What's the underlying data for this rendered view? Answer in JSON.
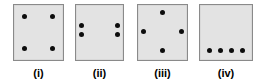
{
  "figure": {
    "width": 265,
    "height": 84,
    "background_color": "#ffffff",
    "square_fill_color": "#e3e3e3",
    "square_border_color": "#8a8a8a",
    "dot_color": "#0d0d0d",
    "dot_count_per_square": 4
  },
  "panels": [
    {
      "label": "(i)",
      "x": 13,
      "y": 4,
      "width": 51,
      "arrangement": "four-corners",
      "dots": [
        {
          "x": 21,
          "y": 21
        },
        {
          "x": 79,
          "y": 21
        },
        {
          "x": 21,
          "y": 79
        },
        {
          "x": 79,
          "y": 79
        }
      ]
    },
    {
      "label": "(ii)",
      "x": 75,
      "y": 4,
      "width": 49,
      "arrangement": "two-vertical-pairs-left-and-right",
      "dots": [
        {
          "x": 12,
          "y": 37
        },
        {
          "x": 12,
          "y": 53
        },
        {
          "x": 88,
          "y": 37
        },
        {
          "x": 88,
          "y": 53
        }
      ]
    },
    {
      "label": "(iii)",
      "x": 137,
      "y": 4,
      "width": 51,
      "arrangement": "diamond",
      "dots": [
        {
          "x": 50,
          "y": 14
        },
        {
          "x": 12,
          "y": 48
        },
        {
          "x": 88,
          "y": 48
        },
        {
          "x": 50,
          "y": 82
        }
      ]
    },
    {
      "label": "(iv)",
      "x": 199,
      "y": 4,
      "width": 54,
      "arrangement": "horizontal-row-near-bottom",
      "dots": [
        {
          "x": 18,
          "y": 83
        },
        {
          "x": 39,
          "y": 83
        },
        {
          "x": 60,
          "y": 83
        },
        {
          "x": 81,
          "y": 83
        }
      ]
    }
  ]
}
